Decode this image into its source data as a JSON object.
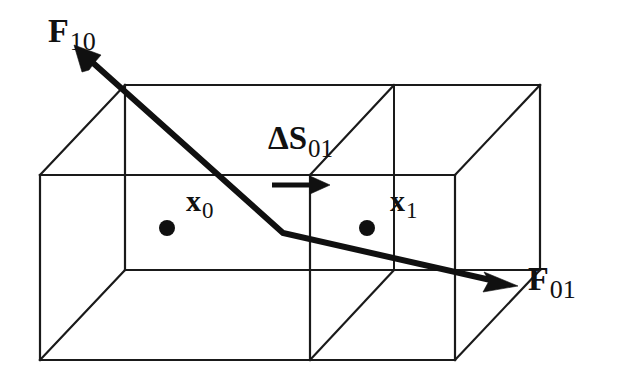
{
  "figure": {
    "background_color": "#ffffff",
    "ink_color": "#101010",
    "width": 619,
    "height": 384
  },
  "labels": {
    "force_10": {
      "symbol": "F",
      "subscript": "10",
      "text": "F10"
    },
    "force_01": {
      "symbol": "F",
      "subscript": "01",
      "text": "F01"
    },
    "delta_s_01": {
      "symbol": "ΔS",
      "subscript": "01",
      "text": "ΔS01"
    },
    "node_x0": {
      "symbol": "x",
      "subscript": "0",
      "text": "x0"
    },
    "node_x1": {
      "symbol": "x",
      "subscript": "1",
      "text": "x1"
    }
  },
  "geometry": {
    "front_face": {
      "left": 40,
      "right": 455,
      "top": 175,
      "bottom": 360,
      "divider_x": 310
    },
    "back_offset": {
      "dx": 85,
      "dy": -90
    },
    "back_divider_x": 253,
    "nodes": [
      {
        "name": "x0",
        "cx": 167,
        "cy": 228,
        "r": 8
      },
      {
        "name": "x1",
        "cx": 367,
        "cy": 228,
        "r": 8
      }
    ],
    "flux_arrow": {
      "x1": 272,
      "y1": 185,
      "x2": 326,
      "y2": 185
    },
    "force_polyline": [
      {
        "x": 92,
        "y": 62
      },
      {
        "x": 283,
        "y": 233
      },
      {
        "x": 497,
        "y": 281
      }
    ],
    "force_arrow_tips": [
      {
        "name": "F10",
        "x": 76,
        "y": 47
      },
      {
        "name": "F01",
        "x": 516,
        "y": 285
      }
    ]
  }
}
